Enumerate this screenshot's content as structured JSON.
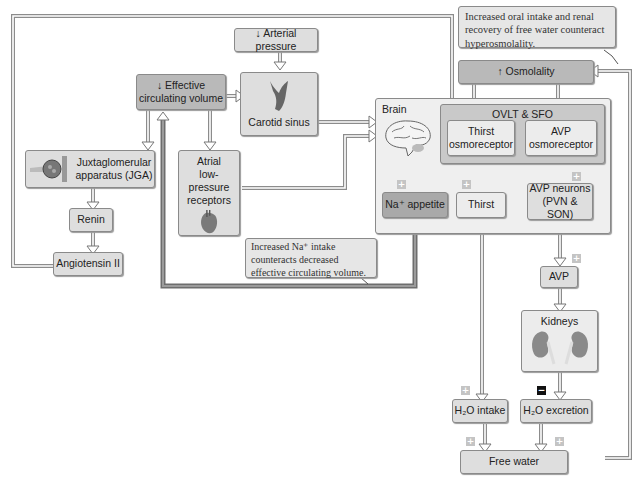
{
  "diagram": {
    "callouts": {
      "top_right": "Increased oral intake and renal recovery of free water counteract hyperosmolality.",
      "bottom_mid_line1": "Increased Na⁺ intake",
      "bottom_mid_line2": "counteracts decreased",
      "bottom_mid_line3": "effective circulating volume."
    },
    "nodes": {
      "arterial_pressure": "↓ Arterial pressure",
      "effective_volume_line1": "↓ Effective",
      "effective_volume_line2": "circulating volume",
      "carotid_sinus": "Carotid sinus",
      "jga_line1": "Juxtaglomerular",
      "jga_line2": "apparatus (JGA)",
      "renin": "Renin",
      "angiotensin": "Angiotensin II",
      "atrial_line1": "Atrial",
      "atrial_line2": "low-pressure",
      "atrial_line3": "receptors",
      "osmolality": "↑ Osmolality",
      "brain": "Brain",
      "ovlt_sfo": "OVLT & SFO",
      "thirst_osmo_line1": "Thirst",
      "thirst_osmo_line2": "osmoreceptor",
      "avp_osmo_line1": "AVP",
      "avp_osmo_line2": "osmoreceptor",
      "na_appetite": "Na⁺ appetite",
      "thirst": "Thirst",
      "avp_neurons_line1": "AVP neurons",
      "avp_neurons_line2": "(PVN & SON)",
      "avp": "AVP",
      "kidneys": "Kidneys",
      "h2o_intake": "H₂O intake",
      "h2o_excretion": "H₂O excretion",
      "free_water": "Free water"
    },
    "signs": {
      "plus": "+",
      "minus": "−"
    },
    "icons": [
      "brain-icon",
      "carotid-sinus-icon",
      "heart-icon",
      "kidneys-icon",
      "jga-icon"
    ],
    "colors": {
      "box_fill": "#dedede",
      "box_dark": "#b9b9b9",
      "region_fill": "#efefef",
      "border": "#8a8a8a",
      "arrow": "#9a9a9a"
    }
  }
}
